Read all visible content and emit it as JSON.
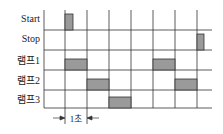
{
  "diagram": {
    "type": "timing-diagram",
    "rows": [
      {
        "label": "Start",
        "pulses": [
          [
            1,
            1.35
          ]
        ],
        "height": "full"
      },
      {
        "label": "Stop",
        "pulses": [
          [
            7,
            7.35
          ]
        ],
        "height": "full"
      },
      {
        "label": "램프1",
        "pulses": [
          [
            1,
            2
          ],
          [
            5,
            6
          ]
        ],
        "height": "half"
      },
      {
        "label": "램프2",
        "pulses": [
          [
            2,
            3
          ],
          [
            6,
            7
          ]
        ],
        "height": "half"
      },
      {
        "label": "램프3",
        "pulses": [
          [
            3,
            4
          ]
        ],
        "height": "half"
      }
    ],
    "time_divisions": 8,
    "dimension": {
      "label": "1초",
      "from": 1,
      "to": 2
    },
    "colors": {
      "pulse_fill": "#9a9a9a",
      "grid": "#333333"
    }
  }
}
